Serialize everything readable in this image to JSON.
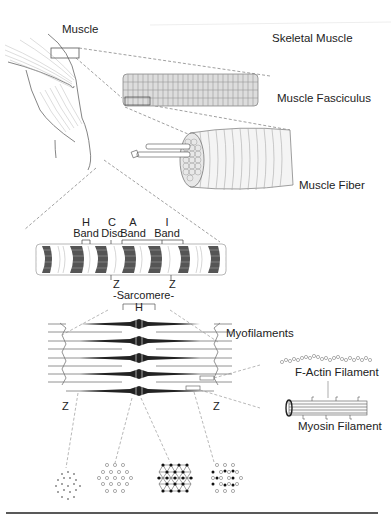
{
  "diagram": {
    "title": "Skeletal Muscle",
    "labels": {
      "muscle": "Muscle",
      "skeletal_muscle": "Skeletal Muscle",
      "fasciculus": "Muscle Fasciculus",
      "fiber": "Muscle Fiber",
      "h_band_top": "H",
      "h_band_bottom": "Band",
      "c_disc_top": "C",
      "c_disc_bottom": "Disc",
      "a_band_top": "A",
      "a_band_bottom": "Band",
      "i_band_top": "I",
      "i_band_bottom": "Band",
      "z_left_myofibril": "Z",
      "z_right_myofibril": "Z",
      "sarcomere": "-Sarcomere-",
      "h_zone": "H",
      "myofilaments": "Myofilaments",
      "z_left_sarcomere": "Z",
      "z_right_sarcomere": "Z",
      "f_actin": "F-Actin Filament",
      "myosin": "Myosin Filament"
    },
    "cross_sections": [
      {
        "name": "I band (actin only)"
      },
      {
        "name": "H zone (myosin only)"
      },
      {
        "name": "M line (myosin cross-linked)"
      },
      {
        "name": "A band (actin + myosin overlap)"
      }
    ]
  }
}
